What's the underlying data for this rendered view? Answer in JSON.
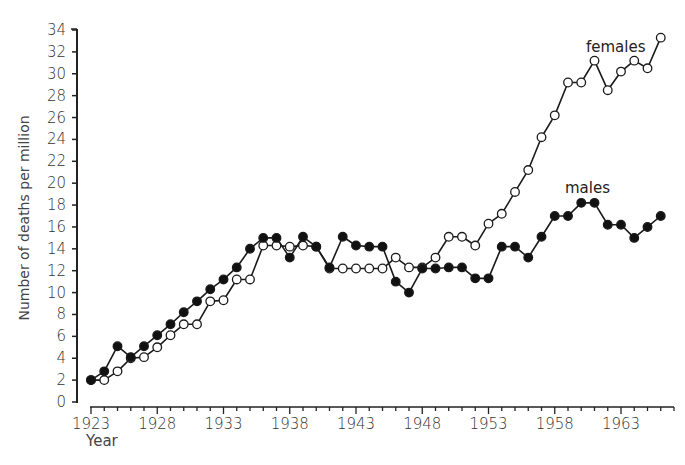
{
  "chart_data": {
    "type": "line",
    "title": "",
    "xlabel": "Year",
    "ylabel": "Number of deaths per million",
    "xlim": [
      1923,
      1967
    ],
    "ylim": [
      0,
      34
    ],
    "grid": false,
    "legend": "inline labels",
    "x_ticks_labeled": [
      1923,
      1928,
      1933,
      1938,
      1943,
      1948,
      1953,
      1958,
      1963
    ],
    "y_ticks": [
      0,
      2,
      4,
      6,
      8,
      10,
      12,
      14,
      16,
      18,
      20,
      22,
      24,
      26,
      28,
      30,
      32,
      34
    ],
    "x": [
      1923,
      1924,
      1925,
      1926,
      1927,
      1928,
      1929,
      1930,
      1931,
      1932,
      1933,
      1934,
      1935,
      1936,
      1937,
      1938,
      1939,
      1940,
      1941,
      1942,
      1943,
      1944,
      1945,
      1946,
      1947,
      1948,
      1949,
      1950,
      1951,
      1952,
      1953,
      1954,
      1955,
      1956,
      1957,
      1958,
      1959,
      1960,
      1961,
      1962,
      1963,
      1964,
      1965,
      1966
    ],
    "series": [
      {
        "name": "males",
        "marker": "filled circle",
        "values": [
          2,
          2.8,
          5.1,
          4.1,
          5.1,
          6.1,
          7.1,
          8.2,
          9.2,
          10.3,
          11.2,
          12.3,
          14,
          15,
          15,
          13.2,
          15.1,
          14.2,
          12.3,
          15.1,
          14.3,
          14.2,
          14.2,
          11,
          10,
          12.2,
          12.2,
          12.3,
          12.3,
          11.3,
          11.3,
          14.2,
          14.2,
          13.2,
          15.1,
          17,
          17,
          18.2,
          18.2,
          16.2,
          16.2,
          15,
          16,
          17
        ]
      },
      {
        "name": "females",
        "marker": "open circle",
        "values": [
          2,
          2,
          2.8,
          4,
          4.1,
          5,
          6.1,
          7.1,
          7.1,
          9.2,
          9.3,
          11.2,
          11.2,
          14.3,
          14.3,
          14.2,
          14.3,
          14.2,
          12.2,
          12.2,
          12.2,
          12.2,
          12.2,
          13.2,
          12.3,
          12.3,
          13.2,
          15.1,
          15.1,
          14.3,
          16.3,
          17.2,
          19.2,
          21.2,
          24.2,
          26.2,
          29.2,
          29.2,
          31.2,
          28.5,
          30.2,
          31.2,
          30.5,
          33.3
        ]
      }
    ],
    "annotations": [
      {
        "text": "females",
        "near": "1964, 32"
      },
      {
        "text": "males",
        "near": "1960, 20"
      }
    ]
  },
  "labels": {
    "ylabel": "Number of deaths per million",
    "xlabel": "Year",
    "females": "females",
    "males": "males"
  }
}
